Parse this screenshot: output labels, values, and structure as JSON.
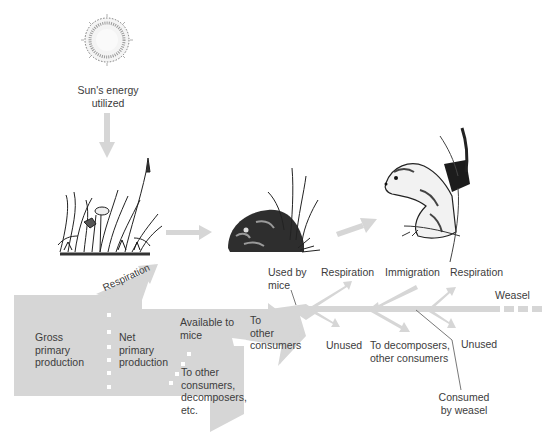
{
  "diagram": {
    "colors": {
      "flow_gray": "#d6d6d6",
      "text": "#3c3c3c",
      "line": "#555555"
    },
    "nodes": {
      "sun": {
        "label": "Sun's energy\nutilized",
        "icon": "sun-icon"
      },
      "plants": {
        "icon": "grass-plants-icon"
      },
      "mouse": {
        "icon": "mouse-icon"
      },
      "weasel": {
        "icon": "weasel-icon"
      }
    },
    "flows": {
      "gross": "Gross\nprimary\nproduction",
      "respiration_plants": "Respiration",
      "net": "Net\nprimary\nproduction",
      "available_to_mice": "Available to\nmice",
      "to_other_consumers_decomposers": "To other\nconsumers,\ndecomposers,\netc.",
      "to_other_consumers": "To\nother\nconsumers",
      "used_by_mice": "Used by\nmice",
      "respiration_mice": "Respiration",
      "unused_mice": "Unused",
      "immigration": "Immigration",
      "to_decomposers_other": "To decomposers,\nother consumers",
      "respiration_weasel": "Respiration",
      "unused_weasel": "Unused",
      "weasel": "Weasel",
      "consumed_by_weasel": "Consumed\nby weasel"
    }
  }
}
